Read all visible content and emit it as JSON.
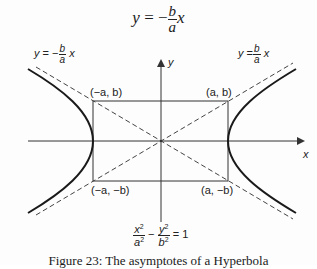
{
  "top_equation": {
    "lhs": "y",
    "equals": "=",
    "sign": "−",
    "numerator": "b",
    "denominator": "a",
    "var": "x"
  },
  "asymptote_labels": {
    "negative": {
      "lhs": "y",
      "equals": "=",
      "sign": "−",
      "numerator": "b",
      "denominator": "a",
      "var": "x"
    },
    "positive": {
      "lhs": "y",
      "equals": "=",
      "sign": "",
      "numerator": "b",
      "denominator": "a",
      "var": "x"
    }
  },
  "axes": {
    "x_label": "x",
    "y_label": "y"
  },
  "corners": {
    "top_left": "(−a, b)",
    "top_right": "(a, b)",
    "bottom_left": "(−a, −b)",
    "bottom_right": "(a, −b)"
  },
  "hyperbola_equation": {
    "term1_num": "x",
    "term1_den": "a",
    "minus": "−",
    "term2_num": "y",
    "term2_den": "b",
    "exp": "2",
    "rhs": "= 1"
  },
  "caption": "Figure 23: The asymptotes of a Hyperbola",
  "colors": {
    "curve": "#1a1a1a",
    "axis": "#333333",
    "dash": "#444444",
    "box": "#333333"
  }
}
